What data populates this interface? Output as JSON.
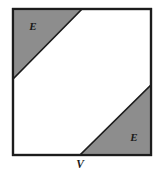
{
  "figure": {
    "name": "square-with-two-shaded-corner-triangles",
    "background_color": "#ffffff",
    "canvas": {
      "width": 160,
      "height": 177
    },
    "square": {
      "name": "outer-square",
      "left": 13,
      "top": 9,
      "right": 151,
      "bottom": 155,
      "stroke_color": "#1c1c1c",
      "stroke_width": 2.2,
      "fill_color": "#ffffff"
    },
    "shaded_regions": [
      {
        "name": "top-left-triangle",
        "label": "E",
        "fill_color": "#8d8d8d",
        "stroke_color": "#1c1c1c",
        "points": "13,9 82,9 13,79",
        "label_x": 33,
        "label_y": 30
      },
      {
        "name": "bottom-right-triangle",
        "label": "E",
        "fill_color": "#8d8d8d",
        "stroke_color": "#1c1c1c",
        "points": "151,85 151,155 80,155",
        "label_x": 134,
        "label_y": 141
      }
    ],
    "point_labels": [
      {
        "name": "vertex-v",
        "label": "V",
        "x": 80,
        "y": 168,
        "marks_point_x": 80,
        "marks_point_y": 155
      }
    ]
  }
}
